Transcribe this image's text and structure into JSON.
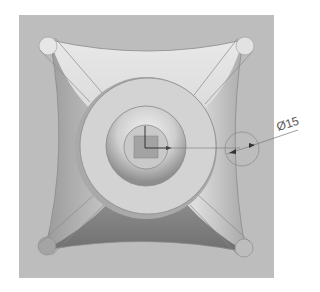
{
  "view": {
    "background": "#ffffff",
    "plate_color": "#bdbdbd",
    "model": "four-lobed knob with center boss"
  },
  "dimension": {
    "symbol": "Ø",
    "value": "15",
    "label": "Ø15"
  },
  "colors": {
    "plate": "#bdbdbd",
    "knob_light": "#e4e4e4",
    "knob_dark": "#7a7a7a",
    "boss": "#d2d2d2",
    "edge_line": "#8a8a8a",
    "dimension_line": "#666666"
  }
}
